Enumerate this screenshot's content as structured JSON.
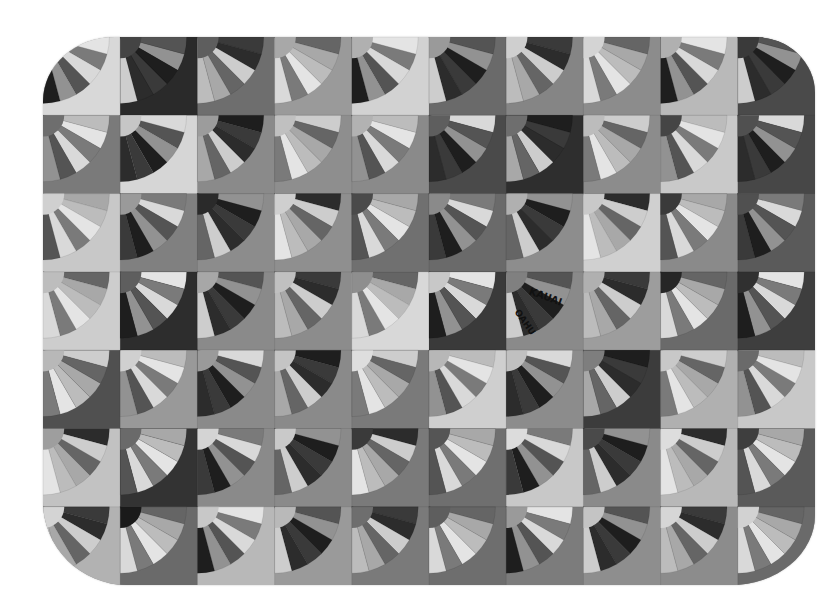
{
  "image": {
    "subject": "Grandmother's Fan patchwork quilt (grayscale photo)",
    "background": "#ffffff",
    "quilt": {
      "columns": 10,
      "rows": 7,
      "block_w": 77.2,
      "block_h": 78.3
    }
  },
  "blocks": [
    [
      "#d8d8d8",
      "#2a2a2a",
      "#6e6e6e",
      "#9a9a9a",
      "#d2d2d2",
      "#6a6a6a",
      "#858585",
      "#8c8c8c",
      "#b9b9b9",
      "#4a4a4a"
    ],
    [
      "#7a7a7a",
      "#d6d6d6",
      "#8a8a8a",
      "#8e8e8e",
      "#8a8a8a",
      "#4a4a4a",
      "#2e2e2e",
      "#8c8c8c",
      "#c9c9c9",
      "#474747"
    ],
    [
      "#c8c8c8",
      "#808080",
      "#8c8c8c",
      "#8f8f8f",
      "#707070",
      "#6a6a6a",
      "#8d8d8d",
      "#d0d0d0",
      "#8a8a8a",
      "#5a5a5a"
    ],
    [
      "#cdcdcd",
      "#2d2d2d",
      "#8a8a8a",
      "#8c8c8c",
      "#d8d8d8",
      "#3a3a3a",
      "#8a8a8a",
      "#9d9d9d",
      "#6a6a6a",
      "#3e3e3e"
    ],
    [
      "#505050",
      "#999999",
      "#8a8a8a",
      "#8a8a8a",
      "#7a7a7a",
      "#cfcfcf",
      "#8c8c8c",
      "#3c3c3c",
      "#b0b0b0",
      "#c8c8c8"
    ],
    [
      "#c2c2c2",
      "#333333",
      "#8a8a8a",
      "#8a8a8a",
      "#7a7a7a",
      "#6f6f6f",
      "#c8c8c8",
      "#8a8a8a",
      "#b8b8b8",
      "#5a5a5a"
    ],
    [
      "#b2b2b2",
      "#6a6a6a",
      "#b8b8b8",
      "#9a9a9a",
      "#7a7a7a",
      "#6e6e6e",
      "#7c7c7c",
      "#8e8e8e",
      "#8c8c8c",
      "#6a6a6a"
    ]
  ],
  "hubs": [
    [
      "#bfbfbf",
      "#444444",
      "#5e5e5e",
      "#a8a8a8",
      "#b0b0b0",
      "#9a9a9a",
      "#cfcfcf",
      "#d4d4d4",
      "#b0b0b0",
      "#3a3a3a"
    ],
    [
      "#6e6e6e",
      "#c6c6c6",
      "#9c9c9c",
      "#c0c0c0",
      "#b2b2b2",
      "#5e5e5e",
      "#6e6e6e",
      "#bcbcbc",
      "#454545",
      "#505050"
    ],
    [
      "#d0d0d0",
      "#9a9a9a",
      "#2a2a2a",
      "#cfcfcf",
      "#4a4a4a",
      "#8a8a8a",
      "#b0b0b0",
      "#c9c9c9",
      "#3a3a3a",
      "#505050"
    ],
    [
      "#bdbdbd",
      "#5e5e5e",
      "#a7a7a7",
      "#c0c0c0",
      "#8e8e8e",
      "#c8c8c8",
      "#808080",
      "#b0b0b0",
      "#262626",
      "#303030"
    ],
    [
      "#b8b8b8",
      "#d0d0d0",
      "#9a9a9a",
      "#c4c4c4",
      "#dedede",
      "#b7b7b7",
      "#c0c0c0",
      "#7e7e7e",
      "#c8c8c8",
      "#6a6a6a"
    ],
    [
      "#9e9e9e",
      "#6a6a6a",
      "#d4d4d4",
      "#c9c9c9",
      "#3a3a3a",
      "#555555",
      "#dcdcdc",
      "#4a4a4a",
      "#dddddd",
      "#3e3e3e"
    ],
    [
      "#d4d4d4",
      "#1a1a1a",
      "#c8c8c8",
      "#b9b9b9",
      "#6e6e6e",
      "#5e5e5e",
      "#9a9a9a",
      "#c4c4c4",
      "#d6d6d6",
      "#d2d2d2"
    ]
  ],
  "blade_palette": [
    "#e4e4e4",
    "#1e1e1e",
    "#a8a8a8",
    "#545454",
    "#cdcdcd",
    "#7a7a7a",
    "#3a3a3a",
    "#bcbcbc",
    "#929292",
    "#656565",
    "#d9d9d9",
    "#2c2c2c"
  ],
  "fabric_prints": [
    {
      "text": "KAUAI",
      "row": 3,
      "col": 6
    },
    {
      "text": "OAHU",
      "row": 3,
      "col": 6
    }
  ]
}
